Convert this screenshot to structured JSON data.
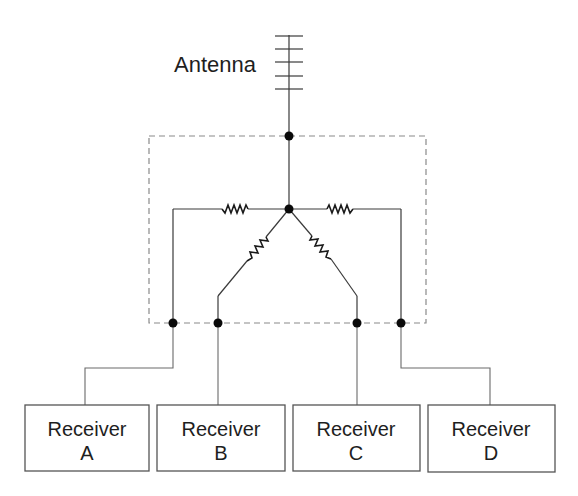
{
  "diagram": {
    "type": "circuit-schematic",
    "antenna": {
      "label": "Antenna"
    },
    "splitter": {
      "style": "dashed-enclosure",
      "resistor_count": 4
    },
    "receivers": [
      {
        "line1": "Receiver",
        "line2": "A"
      },
      {
        "line1": "Receiver",
        "line2": "B"
      },
      {
        "line1": "Receiver",
        "line2": "C"
      },
      {
        "line1": "Receiver",
        "line2": "D"
      }
    ],
    "colors": {
      "wire": "#3a3a3a",
      "dashed_border": "#8a8a8a",
      "junction": "#0a0a0a",
      "box_border": "#555555",
      "text": "#1e1e1e"
    }
  }
}
